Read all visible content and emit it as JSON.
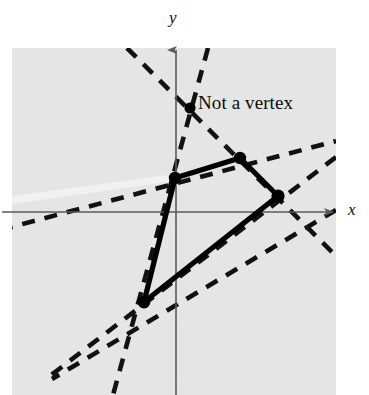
{
  "figure": {
    "background_color": "#ffffff",
    "plot_panel": {
      "name": "gray-plot-panel",
      "fill_color": "#e6e6e6",
      "x": 12,
      "y": 48,
      "width": 324,
      "height": 347
    },
    "axes": {
      "color": "#5a5a5a",
      "origin": {
        "x": 176,
        "y": 212
      },
      "x_axis": {
        "label": "x",
        "from_x": 2,
        "to_x": 341,
        "y": 212,
        "arrow": "right"
      },
      "y_axis": {
        "label": "y",
        "x": 176,
        "from_y": 395,
        "to_y": 42,
        "arrow": "up"
      }
    },
    "annotation": {
      "text": "Not a vertex",
      "point": {
        "x": 190,
        "y": 108
      },
      "label_x": 198,
      "label_y": 92
    },
    "solid_color": "#000000",
    "dashed_color": "#111111",
    "vertices": [
      {
        "name": "left-vertex",
        "x": 175,
        "y": 178
      },
      {
        "name": "top-vertex",
        "x": 240,
        "y": 158
      },
      {
        "name": "right-vertex",
        "x": 278,
        "y": 196
      },
      {
        "name": "bottom-vertex",
        "x": 144,
        "y": 302
      }
    ],
    "polygon_edges": [
      {
        "name": "edge-left-to-top",
        "x1": 175,
        "y1": 178,
        "x2": 240,
        "y2": 158
      },
      {
        "name": "edge-top-to-right",
        "x1": 240,
        "y1": 158,
        "x2": 278,
        "y2": 196
      },
      {
        "name": "edge-right-to-bottom",
        "x1": 278,
        "y1": 196,
        "x2": 144,
        "y2": 302
      },
      {
        "name": "edge-bottom-to-left",
        "x1": 144,
        "y1": 302,
        "x2": 175,
        "y2": 178
      }
    ],
    "dashed_lines": [
      {
        "name": "constraint-line-1",
        "x1": 0,
        "y1": 230,
        "x2": 336,
        "y2": 141
      },
      {
        "name": "constraint-line-2",
        "x1": 127,
        "y1": 48,
        "x2": 336,
        "y2": 256
      },
      {
        "name": "constraint-line-3",
        "x1": 208,
        "y1": 48,
        "x2": 113,
        "y2": 395
      },
      {
        "name": "constraint-line-4",
        "x1": 336,
        "y1": 157,
        "x2": 50,
        "y2": 376
      },
      {
        "name": "constraint-line-5",
        "x1": 336,
        "y1": 210,
        "x2": 52,
        "y2": 379
      }
    ]
  }
}
